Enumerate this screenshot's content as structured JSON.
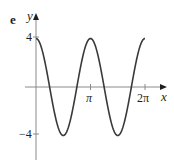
{
  "panel": {
    "label": "e"
  },
  "axes": {
    "x_label": "x",
    "y_label": "y",
    "x_ticks": [
      {
        "label": "π",
        "value": 3.14159
      },
      {
        "label": "2π",
        "value": 6.28319
      }
    ],
    "y_ticks": [
      {
        "label": "4",
        "value": 4
      },
      {
        "label": "−4",
        "value": -4
      }
    ]
  },
  "colors": {
    "curve": "#3a3a3a",
    "axis": "#8a8a8a",
    "text": "#231f20"
  },
  "chart_data": {
    "type": "line",
    "title": "",
    "function": "y = 4cos(2x)",
    "xlabel": "x",
    "ylabel": "y",
    "xlim": [
      0,
      6.2832
    ],
    "ylim": [
      -4,
      4
    ],
    "grid": false,
    "legend": null,
    "x_tick_labels": [
      "π",
      "2π"
    ],
    "y_tick_labels": [
      "4",
      "−4"
    ],
    "key_points": [
      {
        "x": 0,
        "y": 4
      },
      {
        "x": 0.7854,
        "y": 0
      },
      {
        "x": 1.5708,
        "y": -4
      },
      {
        "x": 2.3562,
        "y": 0
      },
      {
        "x": 3.1416,
        "y": 4
      },
      {
        "x": 3.927,
        "y": 0
      },
      {
        "x": 4.7124,
        "y": -4
      },
      {
        "x": 5.4978,
        "y": 0
      },
      {
        "x": 6.2832,
        "y": 4
      }
    ],
    "series": [
      {
        "name": "y = 4cos(2x)",
        "amplitude": 4,
        "period": 3.1416
      }
    ]
  }
}
